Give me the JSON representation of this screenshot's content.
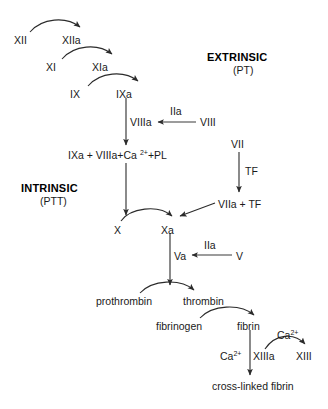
{
  "diagram": {
    "type": "flow-diagram",
    "background_color": "#ffffff",
    "text_color": "#1a1a1a",
    "headings": [
      {
        "id": "extrinsic",
        "label": "EXTRINSIC",
        "sublabel": "(PT)"
      },
      {
        "id": "intrinsic",
        "label": "INTRINSIC",
        "sublabel": "(PTT)"
      }
    ],
    "nodes": [
      {
        "id": "f12",
        "label": "XII"
      },
      {
        "id": "f12a",
        "label": "XIIa"
      },
      {
        "id": "f11",
        "label": "XI"
      },
      {
        "id": "f11a",
        "label": "XIa"
      },
      {
        "id": "f9",
        "label": "IX"
      },
      {
        "id": "f9a",
        "label": "IXa"
      },
      {
        "id": "f8a",
        "label": "VIIIa"
      },
      {
        "id": "f2a_top",
        "label": "IIa"
      },
      {
        "id": "f8",
        "label": "VIII"
      },
      {
        "id": "complex",
        "label": "IXa + VIIIa+Ca",
        "sup": "2+",
        "label_tail": "+PL"
      },
      {
        "id": "f7",
        "label": "VII"
      },
      {
        "id": "tf",
        "label": "TF"
      },
      {
        "id": "f7a_tf",
        "label": "VIIa + TF"
      },
      {
        "id": "f10",
        "label": "X"
      },
      {
        "id": "f10a",
        "label": "Xa"
      },
      {
        "id": "f5a",
        "label": "Va"
      },
      {
        "id": "f2a_mid",
        "label": "IIa"
      },
      {
        "id": "f5",
        "label": "V"
      },
      {
        "id": "prothrombin",
        "label": "prothrombin"
      },
      {
        "id": "thrombin",
        "label": "thrombin"
      },
      {
        "id": "fibrinogen",
        "label": "fibrinogen"
      },
      {
        "id": "fibrin",
        "label": "fibrin"
      },
      {
        "id": "ca_upper",
        "label": "Ca",
        "sup": "2+"
      },
      {
        "id": "ca_lower",
        "label": "Ca",
        "sup": "2+"
      },
      {
        "id": "f13a",
        "label": "XIIIa"
      },
      {
        "id": "f13",
        "label": "XIII"
      },
      {
        "id": "xlink",
        "label": "cross-linked fibrin"
      }
    ],
    "edges": [
      {
        "id": "e1",
        "from": "f12",
        "to": "f12a",
        "style": "curved"
      },
      {
        "id": "e2",
        "from": "f11",
        "to": "f11a",
        "style": "curved"
      },
      {
        "id": "e3",
        "from": "f9",
        "to": "f9a",
        "style": "curved"
      },
      {
        "id": "e4",
        "from": "f9a",
        "to": "complex",
        "style": "straight-down"
      },
      {
        "id": "e5",
        "from": "f8",
        "to": "f8a",
        "style": "straight-left",
        "label": "IIa"
      },
      {
        "id": "e6",
        "from": "complex",
        "to": "f10a",
        "style": "straight-down"
      },
      {
        "id": "e7",
        "from": "f7",
        "to": "f7a_tf",
        "style": "straight-down",
        "label": "TF"
      },
      {
        "id": "e8",
        "from": "f7a_tf",
        "to": "f10a",
        "style": "straight-diagonal"
      },
      {
        "id": "e9",
        "from": "f10",
        "to": "f10a",
        "style": "curved"
      },
      {
        "id": "e10",
        "from": "f10a",
        "to": "prothrombin",
        "style": "straight-down"
      },
      {
        "id": "e11",
        "from": "f5",
        "to": "f5a",
        "style": "straight-left",
        "label": "IIa"
      },
      {
        "id": "e12",
        "from": "prothrombin",
        "to": "thrombin",
        "style": "curved"
      },
      {
        "id": "e13",
        "from": "fibrinogen",
        "to": "fibrin",
        "style": "curved"
      },
      {
        "id": "e14",
        "from": "fibrin",
        "to": "xlink",
        "style": "straight-down"
      },
      {
        "id": "e15",
        "from": "f13",
        "to": "f13a",
        "style": "curved-reverse",
        "label": "Ca2+"
      }
    ]
  }
}
